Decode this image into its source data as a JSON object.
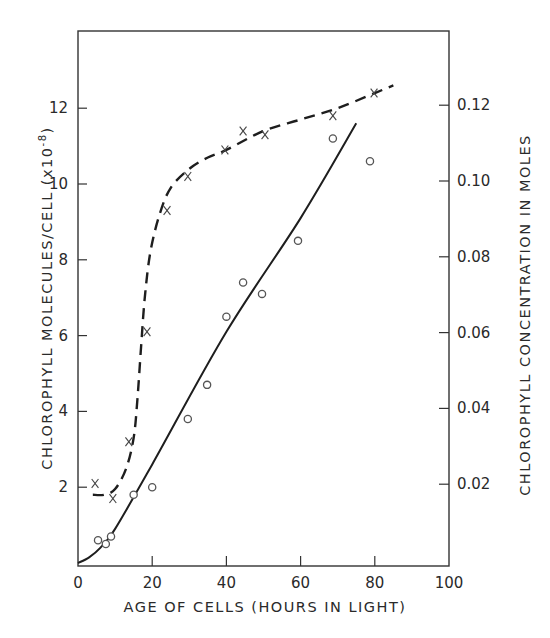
{
  "chart_data": {
    "type": "scatter",
    "title": "",
    "xlabel": "AGE OF CELLS (HOURS IN LIGHT)",
    "ylabel": "CHLOROPHYLL MOLECULES/CELL (x10^-8)",
    "ylabel_parts": {
      "main": "CHLOROPHYLL MOLECULES/CELL (x10",
      "exp": "-8",
      "close": ")"
    },
    "ylabel_right": "CHLOROPHYLL CONCENTRATION IN MOLES",
    "xlim": [
      0,
      100
    ],
    "ylim": [
      0,
      14
    ],
    "ylim_right": [
      0,
      0.14
    ],
    "x_ticks": [
      0,
      20,
      40,
      60,
      80,
      100
    ],
    "x_tick_labels": [
      "0",
      "20",
      "40",
      "60",
      "80",
      "100"
    ],
    "y_ticks": [
      2,
      4,
      6,
      8,
      10,
      12
    ],
    "y_tick_labels": [
      "2",
      "4",
      "6",
      "8",
      "10",
      "12"
    ],
    "y_right_ticks": [
      0.02,
      0.04,
      0.06,
      0.08,
      0.1,
      0.12
    ],
    "y_right_tick_labels": [
      "0.02",
      "0.04",
      "0.06",
      "0.08",
      "0.10",
      "0.12"
    ],
    "grid": false,
    "legend": null,
    "series": [
      {
        "name": "Chlorophyll molecules/cell (circles, solid line)",
        "marker": "o",
        "line": "solid",
        "axis": "left",
        "points": [
          [
            5.4,
            0.6
          ],
          [
            7.5,
            0.5
          ],
          [
            8.9,
            0.7
          ],
          [
            15,
            1.8
          ],
          [
            20,
            2.0
          ],
          [
            29.6,
            3.8
          ],
          [
            34.8,
            4.7
          ],
          [
            40,
            6.5
          ],
          [
            44.5,
            7.4
          ],
          [
            49.6,
            7.1
          ],
          [
            59.3,
            8.5
          ],
          [
            68.7,
            11.2
          ],
          [
            78.7,
            10.6
          ]
        ],
        "fit_line": [
          [
            0,
            0
          ],
          [
            3,
            0.15
          ],
          [
            6,
            0.4
          ],
          [
            10,
            0.9
          ],
          [
            20,
            2.6
          ],
          [
            40,
            6.1
          ],
          [
            60,
            9.1
          ],
          [
            75,
            11.6
          ]
        ]
      },
      {
        "name": "Chlorophyll concentration (crosses, dashed line)",
        "marker": "x",
        "line": "dashed",
        "axis": "left",
        "points": [
          [
            4.6,
            2.1
          ],
          [
            9.4,
            1.7
          ],
          [
            13.7,
            3.2
          ],
          [
            18.6,
            6.1
          ],
          [
            24,
            9.3
          ],
          [
            29.6,
            10.2
          ],
          [
            39.6,
            10.9
          ],
          [
            44.5,
            11.4
          ],
          [
            50.4,
            11.3
          ],
          [
            68.7,
            11.8
          ],
          [
            79.8,
            12.4
          ]
        ],
        "fit_curve": [
          [
            4,
            1.8
          ],
          [
            7,
            1.8
          ],
          [
            10,
            1.95
          ],
          [
            13,
            2.5
          ],
          [
            15,
            3.3
          ],
          [
            16,
            4.3
          ],
          [
            17,
            5.7
          ],
          [
            18,
            7.0
          ],
          [
            19.5,
            8.2
          ],
          [
            22,
            9.2
          ],
          [
            25,
            9.9
          ],
          [
            30,
            10.4
          ],
          [
            35,
            10.7
          ],
          [
            40,
            10.9
          ],
          [
            50,
            11.4
          ],
          [
            60,
            11.7
          ],
          [
            70,
            12.0
          ],
          [
            80,
            12.4
          ],
          [
            85,
            12.6
          ]
        ]
      }
    ]
  },
  "colors": {
    "ink": "#222222",
    "background": "#ffffff",
    "marker": "#555555"
  }
}
